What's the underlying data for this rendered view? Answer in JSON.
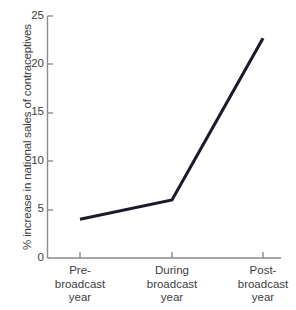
{
  "chart_data": {
    "type": "line",
    "title": "",
    "xlabel": "",
    "ylabel": "% increase in national sales of contraceptives",
    "categories": [
      "Pre-broadcast year",
      "During broadcast year",
      "Post-broadcast year"
    ],
    "values": [
      4,
      6,
      22.7
    ],
    "series": [
      {
        "name": "% increase in national sales of contraceptives",
        "values": [
          4,
          6,
          22.7
        ]
      }
    ],
    "ylim": [
      0,
      25
    ],
    "y_ticks": [
      0,
      5,
      10,
      15,
      20,
      25
    ],
    "y_tick_labels": [
      "0",
      "5",
      "10",
      "15",
      "20",
      "25"
    ],
    "grid": false,
    "legend": false,
    "legend_position": "none",
    "line_color": "#1b1b2b",
    "background_color": "#ffffff",
    "axis_color": "#7a7a7a"
  },
  "axes": {
    "y_title": "% increase in national sales of contraceptives",
    "y_ticks": [
      {
        "label": "25",
        "value": 25
      },
      {
        "label": "20",
        "value": 20
      },
      {
        "label": "15",
        "value": 15
      },
      {
        "label": "10",
        "value": 10
      },
      {
        "label": "5",
        "value": 5
      },
      {
        "label": "0",
        "value": 0
      }
    ],
    "x_ticks": [
      {
        "line1": "Pre-",
        "line2": "broadcast",
        "line3": "year"
      },
      {
        "line1": "During",
        "line2": "broadcast",
        "line3": "year"
      },
      {
        "line1": "Post-",
        "line2": "broadcast",
        "line3": "year"
      }
    ]
  }
}
